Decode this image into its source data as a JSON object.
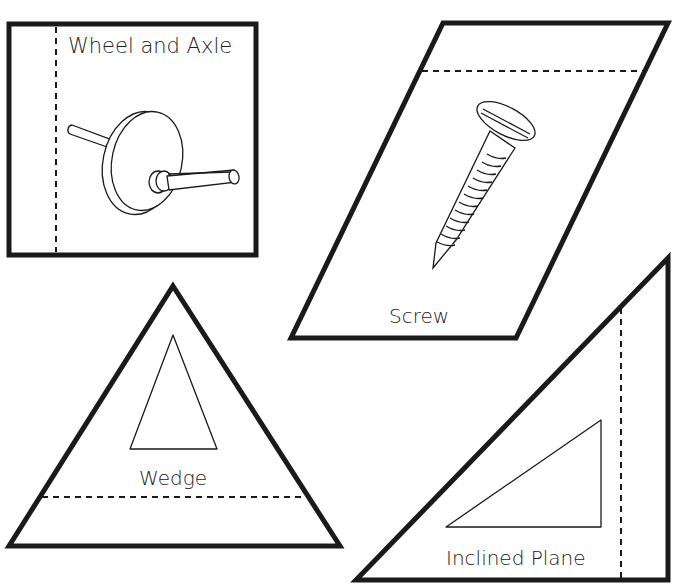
{
  "worksheet": {
    "pieces": [
      {
        "id": "wheel-and-axle",
        "shape": "square",
        "label": "Wheel and Axle",
        "fold_line": "vertical-dashed-left"
      },
      {
        "id": "screw",
        "shape": "parallelogram",
        "label": "Screw",
        "fold_line": "horizontal-dashed-top"
      },
      {
        "id": "wedge",
        "shape": "triangle",
        "label": "Wedge",
        "fold_line": "horizontal-dashed-bottom"
      },
      {
        "id": "inclined-plane",
        "shape": "right-triangle",
        "label": "Inclined Plane",
        "fold_line": "vertical-dashed-right"
      }
    ],
    "colors": {
      "stroke": "#1a1a1a",
      "background": "#ffffff"
    }
  }
}
